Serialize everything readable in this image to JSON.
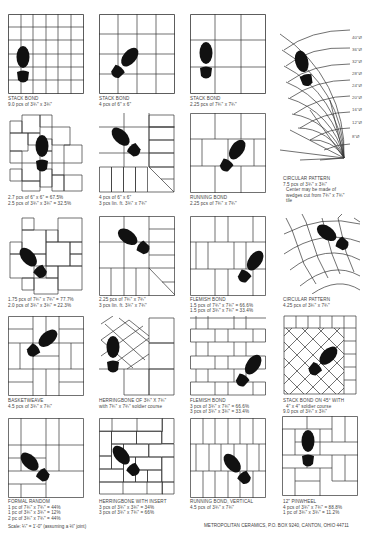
{
  "patterns": [
    {
      "title": "STACK BOND",
      "lines": [
        "9.0 pcs of 3¾\" x 3¾\""
      ]
    },
    {
      "title": "STACK BOND",
      "lines": [
        "4 pcs of 6\" x 6\""
      ]
    },
    {
      "title": "STACK BOND",
      "lines": [
        "2.25 pcs of 7¾\" x 7¾\""
      ]
    },
    {
      "title": "CIRCULAR PATTERN",
      "lines": [
        "7.5 pcs of 3¾\" x 3¾\"",
        "Center may be made of",
        "wedges cut from 7¾\" x 7¾\"",
        "tile"
      ]
    },
    {
      "title": "",
      "lines": [
        "2.7 pcs of 6\" x 6\" = 67.5%",
        "2.5 pcs of 3¾\" x 3¾\" = 32.5%"
      ]
    },
    {
      "title": "",
      "lines": [
        "4 pcs of 6\" x 6\"",
        "3 pcs lin. ft. 3¾\" x 7¾\""
      ]
    },
    {
      "title": "RUNNING BOND",
      "lines": [
        "2.25 pcs of 7¾\" x 7¾\""
      ]
    },
    {
      "title": "",
      "lines": [
        "1.75 pcs of 7¾\" x 7¾\" = 77.7%",
        "2.0 pcs of 3¾\" x 3¾\" = 22.3%"
      ]
    },
    {
      "title": "",
      "lines": [
        "2.25 pcs of 7¾\" x 7¾\"",
        "3 pcs lin. ft. 3¾\" x 7¾\""
      ]
    },
    {
      "title": "FLEMISH BOND",
      "lines": [
        "1.5 pcs of 7¾\" x 7¾\" = 66.6%",
        "1.5 pcs of 3¾\" x 7¾\" = 33.4%"
      ]
    },
    {
      "title": "CIRCULAR PATTERN",
      "lines": [
        "4.25 pcs of 3¾\" x 7¾\""
      ]
    },
    {
      "title": "BASKETWEAVE",
      "lines": [
        "4.5 pcs of 3¾\" x 7¾\""
      ]
    },
    {
      "title": "HERRINGBONE of 3¾\" x 7¾\"",
      "lines": [
        "with 7¾\" x 7¾\" soldier course"
      ]
    },
    {
      "title": "FLEMISH BOND",
      "lines": [
        "3 pcs of 3¾\" x 7¾\" = 66.6%",
        "3 pcs of 3¾\" x 3¾\" = 33.4%"
      ]
    },
    {
      "title": "STACK BOND ON 45° with",
      "lines": [
        "4\" x 4\" soldier course",
        "9.0 pcs of 3¾\" x 3¾\""
      ]
    },
    {
      "title": "FORMAL RANDOM",
      "lines": [
        "1 pc of 7¾\" x 7¾\" = 44%",
        "1 pc of 3¾\" x 3¾\" = 12%",
        "2 pc of 3¾\" x 7¾\" = 44%"
      ]
    },
    {
      "title": "HERRINGBONE with insert",
      "lines": [
        "3 pcs of 3¾\" x 3¾\" = 34%",
        "3 pcs of 3¾\" x 7¾\" = 66%"
      ]
    },
    {
      "title": "RUNNING BOND, VERTICAL",
      "lines": [
        "4.5 pcs of 3¾\" x 7¾\""
      ]
    },
    {
      "title": "12\" PINWHEEL",
      "lines": [
        "4 pcs of 3¾\" x 7¾\" = 88.8%",
        "1 pc of 3¾\" x 3¾\" = 11.2%"
      ]
    }
  ],
  "circular_ticks": [
    "40\"Ø",
    "36\"Ø",
    "32\"Ø",
    "28\"Ø",
    "24\"Ø",
    "20\"Ø",
    "16\"Ø",
    "12\"Ø",
    "8\"Ø"
  ],
  "footer": {
    "scale": "Scale: ¼\" = 1'-0\" (assuming a ⅛\" joint)",
    "company": "METROPOLITAN CERAMICS, P.O. BOX 9240, CANTON, OHIO 44711"
  }
}
